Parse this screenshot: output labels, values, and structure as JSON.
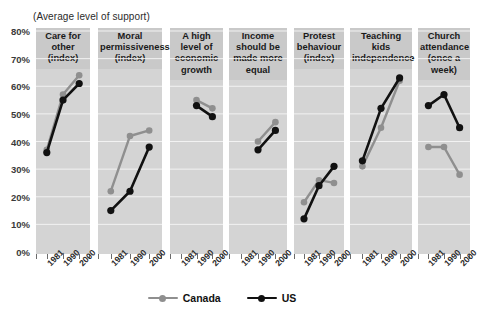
{
  "subtitle": "(Average level of support)",
  "colors": {
    "canada": "#8f8f8f",
    "us": "#111111",
    "panel_bg": "#d4d4d4",
    "header_bg": "#c9c9c9",
    "gridline": "#f2f2f2",
    "axis": "#6b6b6b"
  },
  "y_axis": {
    "min": 0,
    "max": 80,
    "ticks": [
      "80%",
      "70%",
      "60%",
      "50%",
      "40%",
      "30%",
      "20%",
      "10%",
      "0%"
    ],
    "tick_values": [
      80,
      70,
      60,
      50,
      40,
      30,
      20,
      10,
      0
    ]
  },
  "x_axis": {
    "ticks": [
      "1981",
      "1990",
      "2000"
    ]
  },
  "legend": {
    "items": [
      {
        "label": "Canada",
        "color": "#8f8f8f"
      },
      {
        "label": "US",
        "color": "#111111"
      }
    ]
  },
  "chart_data": {
    "type": "line",
    "title": "",
    "subtitle": "(Average level of support)",
    "xlabel": "",
    "ylabel": "",
    "ylim": [
      0,
      80
    ],
    "grid": true,
    "legend_position": "bottom",
    "x": [
      "1981",
      "1990",
      "2000"
    ],
    "panels": [
      {
        "title": "Care for other (index)",
        "title_lines": [
          "Care for",
          "other",
          "(index)"
        ],
        "series": [
          {
            "name": "Canada",
            "values": [
              37,
              57,
              64
            ]
          },
          {
            "name": "US",
            "values": [
              36,
              55,
              61
            ]
          }
        ]
      },
      {
        "title": "Moral permissiveness (index)",
        "title_lines": [
          "Moral",
          "permissiveness",
          "(index)"
        ],
        "series": [
          {
            "name": "Canada",
            "values": [
              22,
              42,
              44
            ]
          },
          {
            "name": "US",
            "values": [
              15,
              22,
              38
            ]
          }
        ]
      },
      {
        "title": "A high level of economic growth",
        "title_lines": [
          "A high",
          "level of",
          "economic",
          "growth"
        ],
        "series": [
          {
            "name": "Canada",
            "values": [
              null,
              55,
              52
            ]
          },
          {
            "name": "US",
            "values": [
              null,
              53,
              49
            ]
          }
        ]
      },
      {
        "title": "Income should be made more equal",
        "title_lines": [
          "Income",
          "should be",
          "made more",
          "equal"
        ],
        "series": [
          {
            "name": "Canada",
            "values": [
              null,
              40,
              47
            ]
          },
          {
            "name": "US",
            "values": [
              null,
              37,
              44
            ]
          }
        ]
      },
      {
        "title": "Protest behaviour (index)",
        "title_lines": [
          "Protest",
          "behaviour",
          "(index)"
        ],
        "series": [
          {
            "name": "Canada",
            "values": [
              18,
              26,
              25
            ]
          },
          {
            "name": "US",
            "values": [
              12,
              24,
              31
            ]
          }
        ]
      },
      {
        "title": "Teaching kids independence",
        "title_lines": [
          "Teaching",
          "kids",
          "independence"
        ],
        "series": [
          {
            "name": "Canada",
            "values": [
              31,
              45,
              62
            ]
          },
          {
            "name": "US",
            "values": [
              33,
              52,
              63
            ]
          }
        ]
      },
      {
        "title": "Church attendance (once a week)",
        "title_lines": [
          "Church",
          "attendance",
          "(once a",
          "week)"
        ],
        "series": [
          {
            "name": "Canada",
            "values": [
              38,
              38,
              28
            ]
          },
          {
            "name": "US",
            "values": [
              53,
              57,
              45
            ]
          }
        ]
      }
    ]
  }
}
